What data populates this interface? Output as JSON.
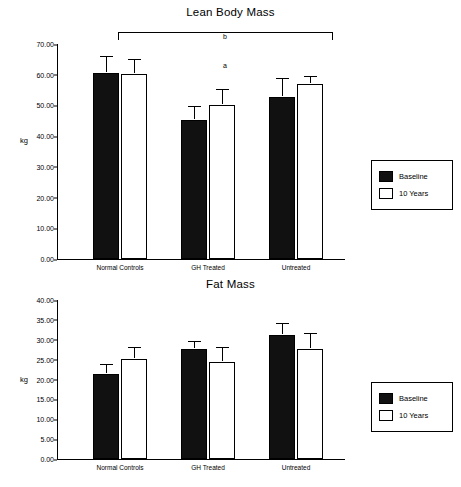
{
  "chart_data": [
    {
      "type": "bar",
      "title": "Lean Body Mass",
      "xlabel": "",
      "ylabel": "kg",
      "ylim": [
        0,
        70
      ],
      "ytick_step": 10,
      "yticks": [
        "0.00",
        "10.00",
        "20.00",
        "30.00",
        "40.00",
        "50.00",
        "60.00",
        "70.00"
      ],
      "categories": [
        "Normal Controls",
        "GH Treated",
        "Untreated"
      ],
      "series": [
        {
          "name": "Baseline",
          "values": [
            60.5,
            45.3,
            52.8
          ],
          "errors": [
            5.0,
            4.0,
            5.5
          ],
          "fill": "#111111"
        },
        {
          "name": "10 Years",
          "values": [
            60.3,
            50.2,
            57.0
          ],
          "errors": [
            4.2,
            4.5,
            2.0
          ],
          "fill": "#ffffff"
        }
      ],
      "annotations": [
        {
          "text": "b",
          "target": "bracket-across-groups"
        },
        {
          "text": "a",
          "target": "gh-treated-group"
        }
      ],
      "legend_position": "right"
    },
    {
      "type": "bar",
      "title": "Fat Mass",
      "xlabel": "",
      "ylabel": "kg",
      "ylim": [
        0,
        40
      ],
      "ytick_step": 5,
      "yticks": [
        "0.00",
        "5.00",
        "10.00",
        "15.00",
        "20.00",
        "25.00",
        "30.00",
        "35.00",
        "40.00"
      ],
      "categories": [
        "Normal Controls",
        "GH Treated",
        "Untreated"
      ],
      "series": [
        {
          "name": "Baseline",
          "values": [
            21.3,
            27.6,
            31.2
          ],
          "errors": [
            2.0,
            1.7,
            2.4
          ],
          "fill": "#111111"
        },
        {
          "name": "10 Years",
          "values": [
            25.2,
            24.4,
            27.6
          ],
          "errors": [
            2.4,
            3.4,
            3.5
          ],
          "fill": "#ffffff"
        }
      ],
      "annotations": [],
      "legend_position": "right"
    }
  ],
  "legend": {
    "baseline_label": "Baseline",
    "tenyears_label": "10 Years"
  }
}
